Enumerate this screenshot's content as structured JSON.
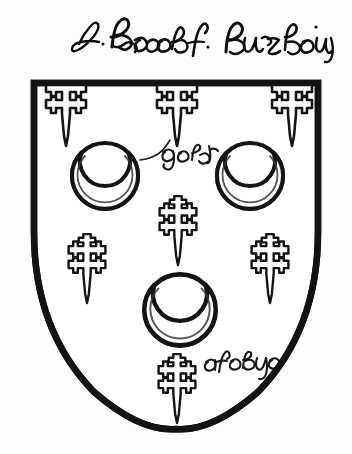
{
  "document": {
    "kind": "heraldic-armorial-plate",
    "background_color": "#fdfdfc",
    "ink_color": "#100f0d"
  },
  "title": {
    "text": "d. Jacobs Burzlow",
    "script_style": "cursive-gothic-handwriting",
    "position": "above-shield"
  },
  "shield": {
    "shape": "heater",
    "outline_color": "#141312",
    "field_color": "#ffffff",
    "border_width_px": 6,
    "bounds": {
      "left": 31,
      "top": 80,
      "right": 321,
      "bottom": 432
    }
  },
  "charges": {
    "crescents": [
      {
        "id": "crescent-dexter-chief",
        "cx": 105,
        "cy": 176,
        "r": 33,
        "label": "crescent"
      },
      {
        "id": "crescent-sinister-chief",
        "cx": 250,
        "cy": 176,
        "r": 33,
        "label": "crescent"
      },
      {
        "id": "crescent-base-center",
        "cx": 180,
        "cy": 310,
        "r": 36,
        "label": "crescent"
      }
    ],
    "crosses": [
      {
        "id": "cross-chief-dexter",
        "cx": 66,
        "cy": 110,
        "label": "cross-crosslet-fitchy"
      },
      {
        "id": "cross-chief-center",
        "cx": 177,
        "cy": 110,
        "label": "cross-crosslet-fitchy"
      },
      {
        "id": "cross-chief-sinister",
        "cx": 292,
        "cy": 110,
        "label": "cross-crosslet-fitchy"
      },
      {
        "id": "cross-fess-center",
        "cx": 178,
        "cy": 232,
        "label": "cross-crosslet-fitchy"
      },
      {
        "id": "cross-fess-dexter",
        "cx": 87,
        "cy": 270,
        "label": "cross-crosslet-fitchy"
      },
      {
        "id": "cross-fess-sinister",
        "cx": 270,
        "cy": 270,
        "label": "cross-crosslet-fitchy"
      },
      {
        "id": "cross-base-center",
        "cx": 177,
        "cy": 390,
        "label": "cross-crosslet-fitchy"
      }
    ]
  },
  "annotations": [
    {
      "id": "tincture-note-gold",
      "text": "gold",
      "x": 182,
      "y": 158,
      "leader_line": true,
      "meaning": "tincture indication for the charges"
    },
    {
      "id": "tincture-note-base",
      "text": "asobyo",
      "x": 208,
      "y": 358,
      "leader_line": false,
      "meaning": "handwritten tincture / blazon note in base"
    }
  ],
  "blazon_summary": {
    "crescent_count": 3,
    "cross_count": 7
  }
}
